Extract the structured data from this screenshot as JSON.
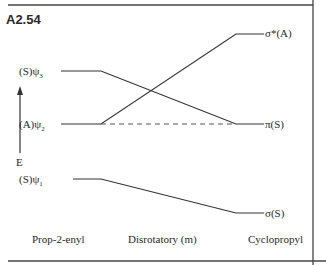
{
  "problem_id": "A2.54",
  "energy_axis_label": "E",
  "left_levels": [
    {
      "label": "(S)ψ",
      "subscript": "3"
    },
    {
      "label": "(A)ψ",
      "subscript": "2"
    },
    {
      "label": "(S)ψ",
      "subscript": "1"
    }
  ],
  "right_levels": [
    {
      "label": "σ*(A)"
    },
    {
      "label": "π(S)"
    },
    {
      "label": "σ(S)"
    }
  ],
  "correlations": [
    {
      "from": "(S)ψ3",
      "to": "π(S)"
    },
    {
      "from": "(A)ψ2",
      "to": "σ*(A)"
    },
    {
      "from": "(S)ψ1",
      "to": "σ(S)"
    }
  ],
  "column_labels": {
    "left": "Prop-2-enyl",
    "middle": "Disrotatory (m)",
    "right": "Cyclopropyl"
  }
}
